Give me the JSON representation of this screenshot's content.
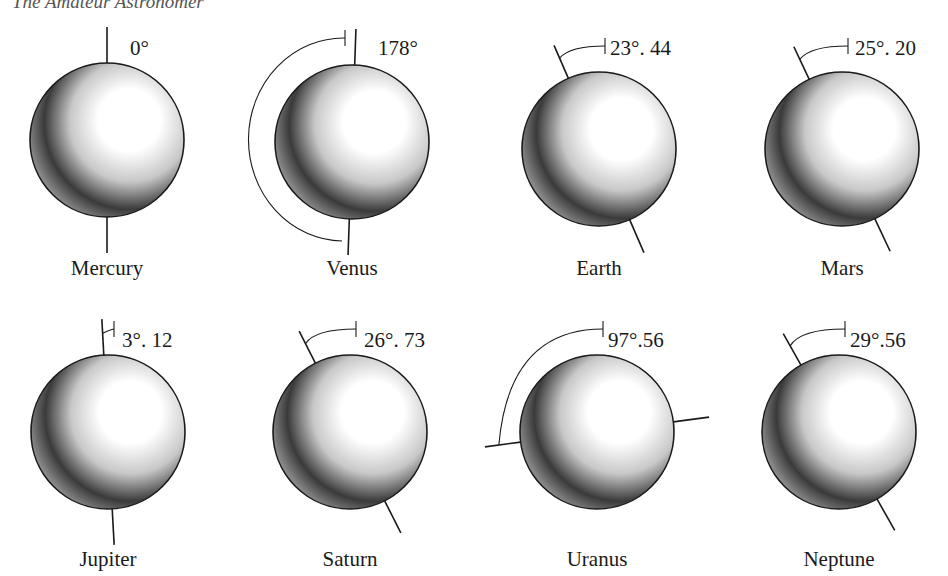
{
  "header": {
    "running_title": "The Amateur Astronomer"
  },
  "diagram": {
    "shading": {
      "highlight": "#ffffff",
      "mid": "#c8c8c8",
      "shadow": "#3a3a3a",
      "rim": "#9a9a9a",
      "ink": "#1a1a1a"
    },
    "planets": [
      {
        "name": "Mercury",
        "tilt_deg": 0,
        "tilt_label": "0°"
      },
      {
        "name": "Venus",
        "tilt_deg": 178,
        "tilt_label": "178°"
      },
      {
        "name": "Earth",
        "tilt_deg": 23.44,
        "tilt_label": "23°. 44"
      },
      {
        "name": "Mars",
        "tilt_deg": 25.2,
        "tilt_label": "25°. 20"
      },
      {
        "name": "Jupiter",
        "tilt_deg": 3.12,
        "tilt_label": "3°. 12"
      },
      {
        "name": "Saturn",
        "tilt_deg": 26.73,
        "tilt_label": "26°. 73"
      },
      {
        "name": "Uranus",
        "tilt_deg": 97.56,
        "tilt_label": "97°.56"
      },
      {
        "name": "Neptune",
        "tilt_deg": 29.56,
        "tilt_label": "29°.56"
      }
    ]
  }
}
